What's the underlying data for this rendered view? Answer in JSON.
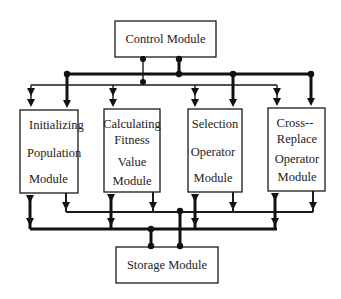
{
  "diagram": {
    "control_module": {
      "label": "Control Module"
    },
    "storage_module": {
      "label": "Storage Module"
    },
    "modules": [
      {
        "lines": [
          "Initializing",
          "Population",
          "Module"
        ]
      },
      {
        "lines": [
          "Calculating",
          "Fitness",
          "Value",
          "Module"
        ]
      },
      {
        "lines": [
          "Selection",
          "Operator",
          "Module"
        ]
      },
      {
        "lines": [
          "Cross--",
          "Replace",
          "Operator",
          "Module"
        ]
      }
    ],
    "connections": [
      {
        "from": "Control Module",
        "to": "control-data-bus",
        "type": "thick"
      },
      {
        "from": "Control Module",
        "to": "control-signal-bus",
        "type": "thin"
      },
      {
        "from": "control-data-bus",
        "to": "modules",
        "type": "thick",
        "direction": "down"
      },
      {
        "from": "control-signal-bus",
        "to": "modules",
        "type": "thin",
        "direction": "bidirectional"
      },
      {
        "from": "modules",
        "to": "storage-input-bus",
        "type": "thin",
        "direction": "down"
      },
      {
        "from": "modules",
        "to": "storage-bidirectional-bus",
        "type": "thick",
        "direction": "bidirectional"
      },
      {
        "from": "storage-input-bus",
        "to": "Storage Module",
        "type": "thick"
      },
      {
        "from": "storage-bidirectional-bus",
        "to": "Storage Module",
        "type": "thick"
      }
    ]
  }
}
